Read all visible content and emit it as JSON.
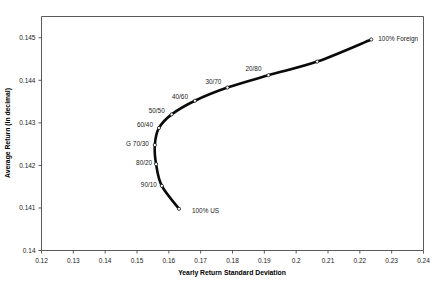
{
  "chart_data": {
    "type": "line",
    "title": "",
    "xlabel": "Yearly Return Standard Deviation",
    "ylabel": "Average Return (in decimal)",
    "xlim": [
      0.12,
      0.24
    ],
    "ylim": [
      0.14,
      0.1455
    ],
    "xticks": [
      "0.12",
      "0.13",
      "0.14",
      "0.15",
      "0.16",
      "0.17",
      "0.18",
      "0.19",
      "0.2",
      "0.21",
      "0.22",
      "0.23",
      "0.24"
    ],
    "xtick_values": [
      0.12,
      0.13,
      0.14,
      0.15,
      0.16,
      0.17,
      0.18,
      0.19,
      0.2,
      0.21,
      0.22,
      0.23,
      0.24
    ],
    "yticks": [
      "0.14",
      "0.141",
      "0.142",
      "0.143",
      "0.144",
      "0.145"
    ],
    "ytick_values": [
      0.14,
      0.141,
      0.142,
      0.143,
      0.144,
      0.145
    ],
    "grid": false,
    "legend": "none",
    "series": [
      {
        "name": "Efficient frontier (US / Foreign allocation)",
        "color": "#0a0a0a",
        "points": [
          {
            "label": "100% US",
            "x": 0.1632,
            "y": 0.14098,
            "label_dx": 13,
            "label_dy": 4,
            "anchor": "start"
          },
          {
            "label": "90/10",
            "x": 0.1578,
            "y": 0.14152,
            "label_dx": -5,
            "label_dy": 1,
            "anchor": "end"
          },
          {
            "label": "80/20",
            "x": 0.156,
            "y": 0.14203,
            "label_dx": -4,
            "label_dy": 1,
            "anchor": "end"
          },
          {
            "label": "G 70/30",
            "x": 0.1556,
            "y": 0.14248,
            "label_dx": -6,
            "label_dy": 1,
            "anchor": "end"
          },
          {
            "label": "60/40",
            "x": 0.1569,
            "y": 0.14288,
            "label_dx": -6,
            "label_dy": -1,
            "anchor": "end"
          },
          {
            "label": "50/50",
            "x": 0.1609,
            "y": 0.1432,
            "label_dx": -7,
            "label_dy": -1,
            "anchor": "end"
          },
          {
            "label": "40/60",
            "x": 0.1682,
            "y": 0.14352,
            "label_dx": -7,
            "label_dy": -2,
            "anchor": "end"
          },
          {
            "label": "30/70",
            "x": 0.1784,
            "y": 0.14383,
            "label_dx": -6,
            "label_dy": -4,
            "anchor": "end"
          },
          {
            "label": "20/80",
            "x": 0.1913,
            "y": 0.14412,
            "label_dx": -7,
            "label_dy": -4,
            "anchor": "end"
          },
          {
            "label": "",
            "x": 0.2066,
            "y": 0.14444,
            "label_dx": 0,
            "label_dy": 0,
            "anchor": "start"
          },
          {
            "label": "100% Foreign",
            "x": 0.2236,
            "y": 0.14496,
            "label_dx": 7,
            "label_dy": 2,
            "anchor": "start"
          }
        ]
      }
    ],
    "annotations": [
      "100% US",
      "90/10",
      "80/20",
      "G 70/30",
      "60/40",
      "50/50",
      "40/60",
      "30/70",
      "20/80",
      "100% Foreign"
    ]
  },
  "colors": {
    "curve": "#0a0a0a",
    "frame": "#5a5a5a",
    "text": "#1a1a1a",
    "background": "#ffffff"
  }
}
